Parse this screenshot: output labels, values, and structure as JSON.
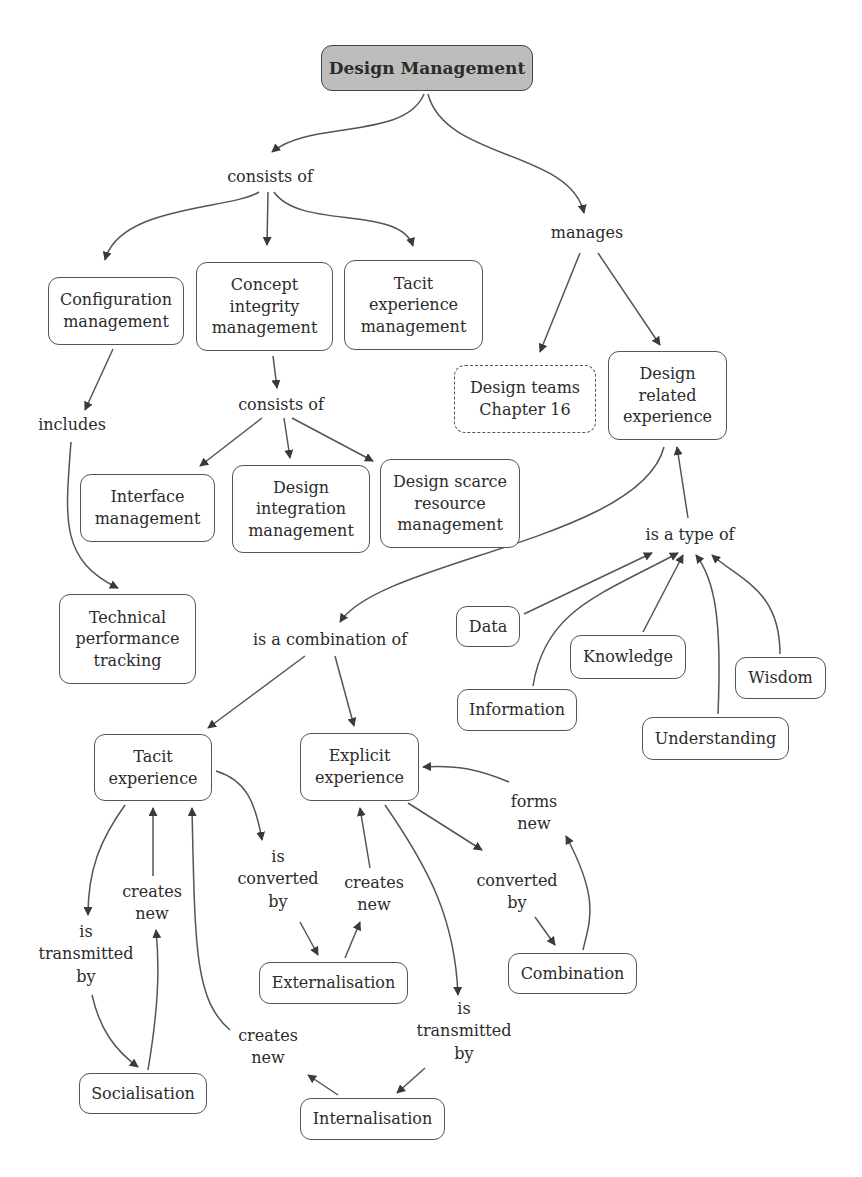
{
  "diagram": {
    "title": "Design Management",
    "colors": {
      "root_fill": "#bdbdbd",
      "stroke": "#555555",
      "arrow": "#3a3a3a",
      "background": "#ffffff"
    },
    "nodes": {
      "root": "Design Management",
      "config_mgmt": "Configuration\nmanagement",
      "concept_integrity": "Concept\nintegrity\nmanagement",
      "tacit_exp_mgmt": "Tacit\nexperience\nmanagement",
      "design_teams": "Design teams\nChapter 16",
      "design_related_exp": "Design\nrelated\nexperience",
      "interface_mgmt": "Interface\nmanagement",
      "design_integration": "Design\nintegration\nmanagement",
      "design_scarce": "Design scarce\nresource\nmanagement",
      "tech_perf": "Technical\nperformance\ntracking",
      "data": "Data",
      "knowledge": "Knowledge",
      "wisdom": "Wisdom",
      "information": "Information",
      "understanding": "Understanding",
      "tacit_exp": "Tacit\nexperience",
      "explicit_exp": "Explicit\nexperience",
      "externalisation": "Externalisation",
      "combination": "Combination",
      "socialisation": "Socialisation",
      "internalisation": "Internalisation"
    },
    "links": {
      "consists_of_top": "consists of",
      "manages": "manages",
      "includes": "includes",
      "consists_of_mid": "consists of",
      "is_combination_of": "is a combination of",
      "is_type_of": "is a type of",
      "is_transmitted_by_left": "is\ntransmitted\nby",
      "creates_new_left": "creates\nnew",
      "is_converted_by": "is\nconverted\nby",
      "creates_new_mid": "creates\nnew",
      "converted_by": "converted\nby",
      "forms_new": "forms\nnew",
      "creates_new_bottom": "creates\nnew",
      "is_transmitted_by_right": "is\ntransmitted\nby"
    },
    "edges": [
      [
        "root",
        "consists_of_top"
      ],
      [
        "root",
        "manages"
      ],
      [
        "consists_of_top",
        "config_mgmt"
      ],
      [
        "consists_of_top",
        "concept_integrity"
      ],
      [
        "consists_of_top",
        "tacit_exp_mgmt"
      ],
      [
        "manages",
        "design_teams"
      ],
      [
        "manages",
        "design_related_exp"
      ],
      [
        "config_mgmt",
        "includes"
      ],
      [
        "includes",
        "tech_perf"
      ],
      [
        "concept_integrity",
        "consists_of_mid"
      ],
      [
        "consists_of_mid",
        "interface_mgmt"
      ],
      [
        "consists_of_mid",
        "design_integration"
      ],
      [
        "consists_of_mid",
        "design_scarce"
      ],
      [
        "design_related_exp",
        "is_combination_of"
      ],
      [
        "is_type_of",
        "design_related_exp"
      ],
      [
        "data",
        "is_type_of"
      ],
      [
        "information",
        "is_type_of"
      ],
      [
        "knowledge",
        "is_type_of"
      ],
      [
        "understanding",
        "is_type_of"
      ],
      [
        "wisdom",
        "is_type_of"
      ],
      [
        "is_combination_of",
        "tacit_exp"
      ],
      [
        "is_combination_of",
        "explicit_exp"
      ],
      [
        "tacit_exp",
        "is_transmitted_by_left"
      ],
      [
        "is_transmitted_by_left",
        "socialisation"
      ],
      [
        "socialisation",
        "creates_new_left"
      ],
      [
        "creates_new_left",
        "tacit_exp"
      ],
      [
        "tacit_exp",
        "is_converted_by"
      ],
      [
        "is_converted_by",
        "externalisation"
      ],
      [
        "externalisation",
        "creates_new_mid"
      ],
      [
        "creates_new_mid",
        "explicit_exp"
      ],
      [
        "explicit_exp",
        "converted_by"
      ],
      [
        "converted_by",
        "combination"
      ],
      [
        "combination",
        "forms_new"
      ],
      [
        "forms_new",
        "explicit_exp"
      ],
      [
        "explicit_exp",
        "is_transmitted_by_right"
      ],
      [
        "is_transmitted_by_right",
        "internalisation"
      ],
      [
        "internalisation",
        "creates_new_bottom"
      ],
      [
        "creates_new_bottom",
        "tacit_exp"
      ]
    ]
  }
}
